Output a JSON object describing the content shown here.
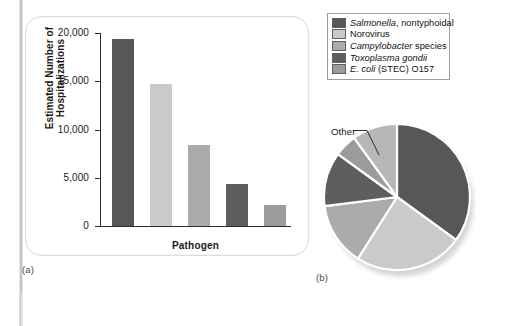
{
  "figure": {
    "caption_a": "(a)",
    "caption_b": "(b)"
  },
  "chart_data": [
    {
      "type": "bar",
      "title": "",
      "xlabel": "Pathogen",
      "ylabel": "Estimated Number of Hospitalizations",
      "categories": [
        "Salmonella, nontyphoidal",
        "Norovirus",
        "Campylobacter species",
        "Toxoplasma gondii",
        "E. coli (STEC) O157"
      ],
      "values": [
        19400,
        14700,
        8400,
        4400,
        2200
      ],
      "ylim": [
        0,
        20000
      ],
      "yticks": [
        0,
        5000,
        10000,
        15000,
        20000
      ],
      "ytick_labels": [
        "0",
        "5,000",
        "10,000",
        "15,000",
        "20,000"
      ],
      "grid": false,
      "legend_position": "external-top-right",
      "colors": [
        "#575757",
        "#cacaca",
        "#ababab",
        "#5e5e5e",
        "#9b9b9b"
      ]
    },
    {
      "type": "pie",
      "title": "",
      "labels": [
        "Salmonella, nontyphoidal",
        "Norovirus",
        "Campylobacter species",
        "Toxoplasma gondii",
        "E. coli (STEC) O157",
        "Other"
      ],
      "values": [
        35,
        24,
        14,
        12,
        5,
        10
      ],
      "start_angle": -90,
      "colors": [
        "#575757",
        "#cacaca",
        "#ababab",
        "#5e5e5e",
        "#9b9b9b",
        "#b7b7b7"
      ],
      "annotations": [
        {
          "text": "Other",
          "target_slice": "Other"
        }
      ]
    }
  ],
  "legend": {
    "items": [
      {
        "label_italic": "Salmonella",
        "label_rest": ", nontyphoidal",
        "swatch": "#575757",
        "icon": "legend-swatch-icon"
      },
      {
        "label_italic": "",
        "label_rest": "Norovirus",
        "swatch": "#cacaca",
        "icon": "legend-swatch-icon"
      },
      {
        "label_italic": "Campylobacter",
        "label_rest": " species",
        "swatch": "#ababab",
        "icon": "legend-swatch-icon"
      },
      {
        "label_italic": "Toxoplasma gondii",
        "label_rest": "",
        "swatch": "#5e5e5e",
        "icon": "legend-swatch-icon"
      },
      {
        "label_italic": "E. coli",
        "label_rest": " (STEC) O157",
        "swatch": "#9b9b9b",
        "icon": "legend-swatch-icon"
      }
    ]
  }
}
